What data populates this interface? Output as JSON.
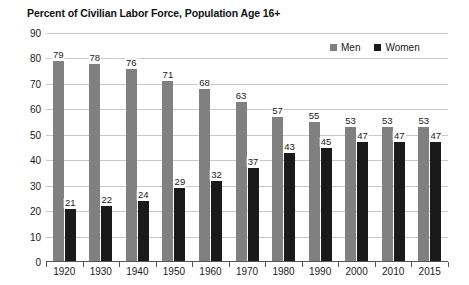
{
  "chart_data": {
    "type": "bar",
    "title": "Percent of Civilian Labor Force, Population Age 16+",
    "xlabel": "",
    "ylabel": "",
    "ylim": [
      0,
      90
    ],
    "ytick_step": 10,
    "yticks": [
      0,
      10,
      20,
      30,
      40,
      50,
      60,
      70,
      80,
      90
    ],
    "grid": true,
    "legend_position": "top-right",
    "categories": [
      "1920",
      "1930",
      "1940",
      "1950",
      "1960",
      "1970",
      "1980",
      "1990",
      "2000",
      "2010",
      "2015"
    ],
    "series": [
      {
        "name": "Men",
        "color": "#808080",
        "values": [
          79,
          78,
          76,
          71,
          68,
          63,
          57,
          55,
          53,
          53,
          53
        ]
      },
      {
        "name": "Women",
        "color": "#1a1a1a",
        "values": [
          21,
          22,
          24,
          29,
          32,
          37,
          43,
          45,
          47,
          47,
          47
        ]
      }
    ]
  },
  "legend": {
    "items": [
      {
        "label": "Men",
        "swatch": "men-swatch-icon"
      },
      {
        "label": "Women",
        "swatch": "women-swatch-icon"
      }
    ]
  }
}
